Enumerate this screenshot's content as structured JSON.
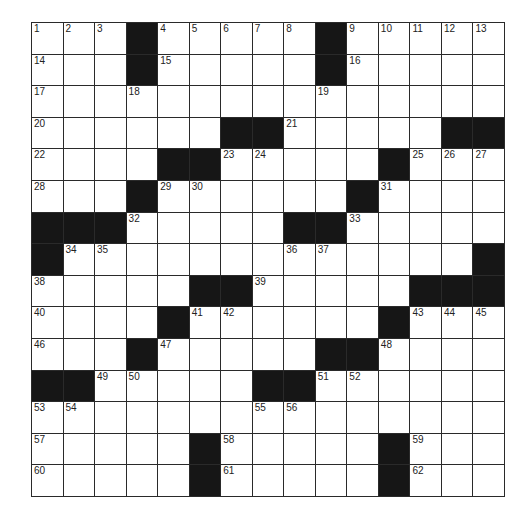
{
  "puzzle": {
    "rows": 15,
    "cols": 15,
    "colors": {
      "block": "#161616",
      "cell": "#ffffff",
      "line": "#2a2a2a"
    },
    "grid": [
      "...#.....#.....",
      "...#.....#.....",
      "...............",
      "......##.....##",
      "....##.....#...",
      "...#......#....",
      "###.....##.....",
      "#.............#",
      ".....##.....###",
      "....#......#...",
      "...#.....##....",
      "##.....##......",
      "...............",
      ".....#.....#...",
      ".....#.....#..."
    ],
    "numbers": [
      {
        "r": 0,
        "c": 0,
        "n": "1"
      },
      {
        "r": 0,
        "c": 1,
        "n": "2"
      },
      {
        "r": 0,
        "c": 2,
        "n": "3"
      },
      {
        "r": 0,
        "c": 4,
        "n": "4"
      },
      {
        "r": 0,
        "c": 5,
        "n": "5"
      },
      {
        "r": 0,
        "c": 6,
        "n": "6"
      },
      {
        "r": 0,
        "c": 7,
        "n": "7"
      },
      {
        "r": 0,
        "c": 8,
        "n": "8"
      },
      {
        "r": 0,
        "c": 10,
        "n": "9"
      },
      {
        "r": 0,
        "c": 11,
        "n": "10"
      },
      {
        "r": 0,
        "c": 12,
        "n": "11"
      },
      {
        "r": 0,
        "c": 13,
        "n": "12"
      },
      {
        "r": 0,
        "c": 14,
        "n": "13"
      },
      {
        "r": 1,
        "c": 0,
        "n": "14"
      },
      {
        "r": 1,
        "c": 4,
        "n": "15"
      },
      {
        "r": 1,
        "c": 10,
        "n": "16"
      },
      {
        "r": 2,
        "c": 0,
        "n": "17"
      },
      {
        "r": 2,
        "c": 3,
        "n": "18"
      },
      {
        "r": 2,
        "c": 9,
        "n": "19"
      },
      {
        "r": 3,
        "c": 0,
        "n": "20"
      },
      {
        "r": 3,
        "c": 8,
        "n": "21"
      },
      {
        "r": 4,
        "c": 0,
        "n": "22"
      },
      {
        "r": 4,
        "c": 6,
        "n": "23"
      },
      {
        "r": 4,
        "c": 7,
        "n": "24"
      },
      {
        "r": 4,
        "c": 12,
        "n": "25"
      },
      {
        "r": 4,
        "c": 13,
        "n": "26"
      },
      {
        "r": 4,
        "c": 14,
        "n": "27"
      },
      {
        "r": 5,
        "c": 0,
        "n": "28"
      },
      {
        "r": 5,
        "c": 4,
        "n": "29"
      },
      {
        "r": 5,
        "c": 5,
        "n": "30"
      },
      {
        "r": 5,
        "c": 11,
        "n": "31"
      },
      {
        "r": 6,
        "c": 3,
        "n": "32"
      },
      {
        "r": 6,
        "c": 10,
        "n": "33"
      },
      {
        "r": 7,
        "c": 1,
        "n": "34"
      },
      {
        "r": 7,
        "c": 2,
        "n": "35"
      },
      {
        "r": 7,
        "c": 8,
        "n": "36"
      },
      {
        "r": 7,
        "c": 9,
        "n": "37"
      },
      {
        "r": 8,
        "c": 0,
        "n": "38"
      },
      {
        "r": 8,
        "c": 7,
        "n": "39"
      },
      {
        "r": 9,
        "c": 0,
        "n": "40"
      },
      {
        "r": 9,
        "c": 5,
        "n": "41"
      },
      {
        "r": 9,
        "c": 6,
        "n": "42"
      },
      {
        "r": 9,
        "c": 12,
        "n": "43"
      },
      {
        "r": 9,
        "c": 13,
        "n": "44"
      },
      {
        "r": 9,
        "c": 14,
        "n": "45"
      },
      {
        "r": 10,
        "c": 0,
        "n": "46"
      },
      {
        "r": 10,
        "c": 4,
        "n": "47"
      },
      {
        "r": 10,
        "c": 11,
        "n": "48"
      },
      {
        "r": 11,
        "c": 2,
        "n": "49"
      },
      {
        "r": 11,
        "c": 3,
        "n": "50"
      },
      {
        "r": 11,
        "c": 9,
        "n": "51"
      },
      {
        "r": 11,
        "c": 10,
        "n": "52"
      },
      {
        "r": 12,
        "c": 0,
        "n": "53"
      },
      {
        "r": 12,
        "c": 1,
        "n": "54"
      },
      {
        "r": 12,
        "c": 7,
        "n": "55"
      },
      {
        "r": 12,
        "c": 8,
        "n": "56"
      },
      {
        "r": 13,
        "c": 0,
        "n": "57"
      },
      {
        "r": 13,
        "c": 6,
        "n": "58"
      },
      {
        "r": 13,
        "c": 12,
        "n": "59"
      },
      {
        "r": 14,
        "c": 0,
        "n": "60"
      },
      {
        "r": 14,
        "c": 6,
        "n": "61"
      },
      {
        "r": 14,
        "c": 12,
        "n": "62"
      }
    ]
  }
}
